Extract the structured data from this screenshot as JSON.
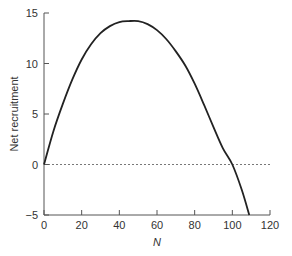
{
  "chart_data": {
    "type": "line",
    "title": "",
    "xlabel": "N",
    "ylabel": "Net recruitment",
    "xlim": [
      0,
      120
    ],
    "ylim": [
      -5,
      15
    ],
    "xticks": [
      0,
      20,
      40,
      60,
      80,
      100,
      120
    ],
    "yticks": [
      -5,
      0,
      5,
      10,
      15
    ],
    "grid": false,
    "legend": null,
    "reference_line": {
      "y": 0,
      "style": "dashed"
    },
    "series": [
      {
        "name": "Net recruitment",
        "x": [
          0,
          5,
          10,
          15,
          20,
          25,
          30,
          35,
          40,
          45,
          50,
          55,
          60,
          65,
          70,
          75,
          80,
          85,
          90,
          95,
          100,
          105,
          109
        ],
        "y": [
          0,
          3.3,
          6.0,
          8.4,
          10.4,
          11.9,
          13.0,
          13.7,
          14.1,
          14.2,
          14.2,
          13.9,
          13.3,
          12.4,
          11.2,
          9.8,
          8.0,
          5.9,
          3.7,
          1.6,
          0,
          -2.5,
          -5.0
        ]
      }
    ]
  }
}
